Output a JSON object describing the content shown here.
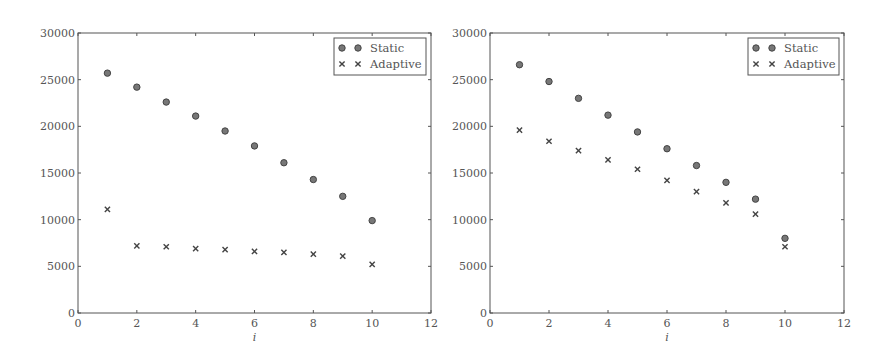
{
  "chart_data": [
    {
      "type": "scatter",
      "title": "",
      "xlabel": "i",
      "ylabel": "",
      "xlim": [
        0,
        12
      ],
      "ylim": [
        0,
        30000
      ],
      "xticks": [
        0,
        2,
        4,
        6,
        8,
        10,
        12
      ],
      "yticks": [
        0,
        5000,
        10000,
        15000,
        20000,
        25000,
        30000
      ],
      "grid": false,
      "legend_position": "upper right",
      "x": [
        1,
        2,
        3,
        4,
        5,
        6,
        7,
        8,
        9,
        10
      ],
      "series": [
        {
          "name": "Static",
          "marker": "circle",
          "values": [
            25700,
            24200,
            22600,
            21100,
            19500,
            17900,
            16100,
            14300,
            12500,
            9900
          ]
        },
        {
          "name": "Adaptive",
          "marker": "x",
          "values": [
            11100,
            7200,
            7100,
            6900,
            6800,
            6600,
            6500,
            6300,
            6100,
            5200
          ]
        }
      ]
    },
    {
      "type": "scatter",
      "title": "",
      "xlabel": "i",
      "ylabel": "",
      "xlim": [
        0,
        12
      ],
      "ylim": [
        0,
        30000
      ],
      "xticks": [
        0,
        2,
        4,
        6,
        8,
        10,
        12
      ],
      "yticks": [
        0,
        5000,
        10000,
        15000,
        20000,
        25000,
        30000
      ],
      "grid": false,
      "legend_position": "upper right",
      "x": [
        1,
        2,
        3,
        4,
        5,
        6,
        7,
        8,
        9,
        10
      ],
      "series": [
        {
          "name": "Static",
          "marker": "circle",
          "values": [
            26600,
            24800,
            23000,
            21200,
            19400,
            17600,
            15800,
            14000,
            12200,
            8000
          ]
        },
        {
          "name": "Adaptive",
          "marker": "x",
          "values": [
            19600,
            18400,
            17400,
            16400,
            15400,
            14200,
            13000,
            11800,
            10600,
            7100
          ]
        }
      ]
    }
  ],
  "colors": {
    "axis": "#555555",
    "marker_fill": "#777777",
    "marker_stroke": "#444444",
    "text": "#555555"
  }
}
